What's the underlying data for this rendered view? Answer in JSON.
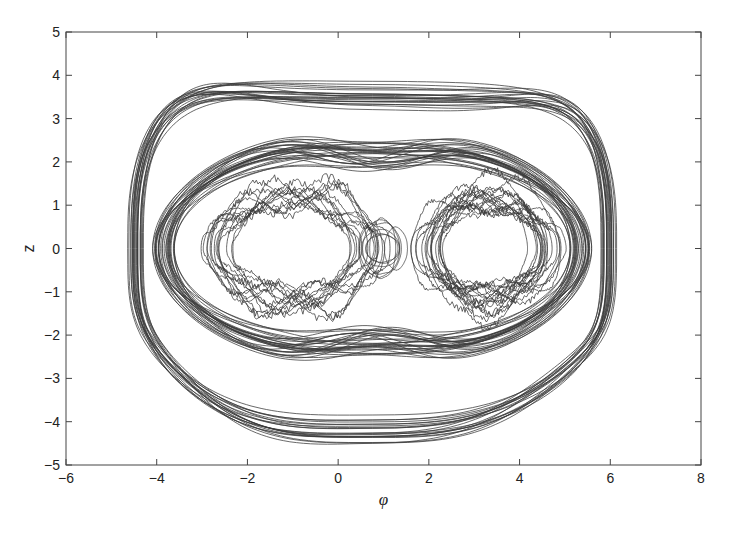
{
  "chart_data": {
    "type": "line",
    "title": "",
    "xlabel": "φ",
    "ylabel": "z",
    "xlim": [
      -6,
      8
    ],
    "ylim": [
      -5,
      5
    ],
    "xticks": [
      -6,
      -4,
      -2,
      0,
      2,
      4,
      6,
      8
    ],
    "yticks": [
      -5,
      -4,
      -3,
      -2,
      -1,
      0,
      1,
      2,
      3,
      4,
      5
    ],
    "grid": false,
    "legend": null,
    "line_color": "#3a3a3a",
    "series": [
      {
        "name": "outer-envelope",
        "kind": "superellipse",
        "center": [
          0.75,
          0
        ],
        "radius_x": [
          5.0,
          5.4
        ],
        "radius_y": [
          3.6,
          4.1
        ],
        "exponent": 3.2,
        "count": 22
      },
      {
        "name": "figure-eight-band",
        "kind": "figure8",
        "center": [
          0.75,
          0
        ],
        "half_width": [
          4.3,
          5.0
        ],
        "amplitude": [
          2.1,
          3.0
        ],
        "waist": [
          1.9,
          2.6
        ],
        "count": 30
      },
      {
        "name": "left-lobe",
        "kind": "lobe",
        "center": [
          -1.0,
          0
        ],
        "radius_x": [
          1.5,
          1.9
        ],
        "radius_y": [
          0.9,
          1.5
        ],
        "ripple": 0.35,
        "count": 14
      },
      {
        "name": "right-lobe",
        "kind": "lobe",
        "center": [
          3.3,
          0
        ],
        "radius_x": [
          1.1,
          1.6
        ],
        "radius_y": [
          0.9,
          1.5
        ],
        "ripple": 0.3,
        "count": 18
      },
      {
        "name": "center-small-loops",
        "kind": "lobe",
        "center": [
          1.0,
          0
        ],
        "radius_x": [
          0.2,
          0.5
        ],
        "radius_y": [
          0.3,
          0.7
        ],
        "ripple": 0.05,
        "count": 8
      }
    ]
  }
}
